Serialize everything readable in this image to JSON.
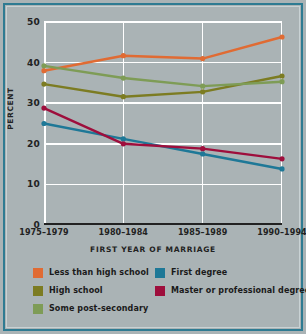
{
  "chart_data": {
    "type": "line",
    "title": "",
    "xlabel": "FIRST YEAR OF MARRIAGE",
    "ylabel": "PERCENT",
    "categories": [
      "1975–1979",
      "1980–1984",
      "1985–1989",
      "1990–1994"
    ],
    "ylim": [
      0,
      50
    ],
    "yticks": [
      0,
      10,
      20,
      30,
      40,
      50
    ],
    "grid": true,
    "legend_position": "bottom",
    "series": [
      {
        "name": "Less than high school",
        "color": "#e06b33",
        "values": [
          38.0,
          41.7,
          41.0,
          46.3
        ]
      },
      {
        "name": "High school",
        "color": "#7c7c22",
        "values": [
          34.7,
          31.6,
          32.8,
          36.7
        ]
      },
      {
        "name": "Some post-secondary",
        "color": "#7e9c56",
        "values": [
          39.2,
          36.2,
          34.2,
          35.3
        ]
      },
      {
        "name": "First degree",
        "color": "#1e7897",
        "values": [
          25.0,
          21.2,
          17.5,
          13.8
        ]
      },
      {
        "name": "Master or professional degree",
        "color": "#9e0e3c",
        "values": [
          28.8,
          20.0,
          18.8,
          16.3
        ]
      }
    ]
  },
  "axis": {
    "y_tick_labels": [
      "50",
      "40",
      "30",
      "20",
      "10",
      "0"
    ],
    "y_title": "PERCENT",
    "x_title": "FIRST YEAR OF MARRIAGE",
    "x_tick_labels": [
      "1975–1979",
      "1980–1984",
      "1985–1989",
      "1990–1994"
    ]
  },
  "legend": {
    "left_column": [
      {
        "label": "Less than high school",
        "color": "#e06b33"
      },
      {
        "label": "High school",
        "color": "#7c7c22"
      },
      {
        "label": "Some post-secondary",
        "color": "#7e9c56"
      }
    ],
    "right_column": [
      {
        "label": "First degree",
        "color": "#1e7897"
      },
      {
        "label": "Master or professional degree",
        "color": "#9e0e3c"
      }
    ]
  },
  "theme": {
    "background": "#aab3b5",
    "frame_border": "#2e7b92",
    "grid_color": "#ffffff",
    "axis_color": "#222222"
  }
}
